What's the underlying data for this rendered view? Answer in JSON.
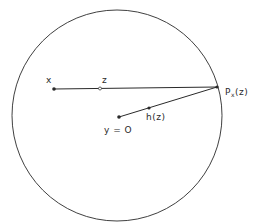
{
  "diagram": {
    "type": "geometric-construction",
    "colors": {
      "stroke": "#2a2a2a",
      "background": "#ffffff"
    },
    "circle": {
      "cx": 117,
      "cy": 115,
      "rx": 105,
      "ry": 105.5
    },
    "points": [
      {
        "id": "x",
        "label": "x",
        "x": 54,
        "y": 89,
        "style": "filled"
      },
      {
        "id": "z",
        "label": "z",
        "x": 100,
        "y": 89,
        "style": "open"
      },
      {
        "id": "Pxz",
        "label": "P",
        "subscript": "x",
        "suffix": "(z)",
        "x": 217,
        "y": 87,
        "style": "filled"
      },
      {
        "id": "y0",
        "label": "y = O",
        "x": 119,
        "y": 117,
        "style": "filled"
      },
      {
        "id": "hz",
        "label": "h(z)",
        "x": 149,
        "y": 108,
        "style": "filled"
      }
    ],
    "segments": [
      {
        "from": "x",
        "to": "Pxz"
      },
      {
        "from": "y0",
        "to": "Pxz"
      }
    ],
    "labels": {
      "x": "x",
      "z": "z",
      "P": "P",
      "P_sub": "x",
      "P_arg": "(z)",
      "h": "h(z)",
      "y": "y = O"
    }
  }
}
